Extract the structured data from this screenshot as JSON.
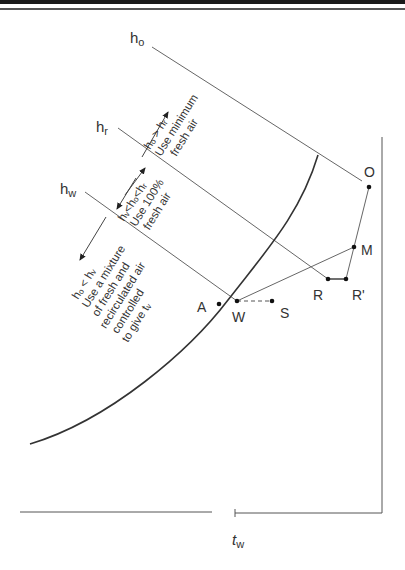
{
  "diagram": {
    "labels": {
      "h_o": "h",
      "h_o_sub": "o",
      "h_r": "h",
      "h_r_sub": "r",
      "h_w": "h",
      "h_w_sub": "w",
      "t_w": "t",
      "t_w_sub": "w"
    },
    "points": {
      "O": "O",
      "M": "M",
      "R": "R",
      "R_prime": "R'",
      "W": "W",
      "S": "S",
      "A": "A"
    },
    "regions": {
      "top": {
        "condition": "hₒ > hᵣ",
        "line1": "Use minimum",
        "line2": "fresh air"
      },
      "middle": {
        "condition": "hᵥ<hₒ<hᵣ",
        "line1": "Use 100%",
        "line2": "fresh air"
      },
      "bottom": {
        "condition": "hₒ < hᵥ",
        "line1": "Use a mixture",
        "line2": "of fresh and",
        "line3": "recirculated air",
        "line4": "controlled",
        "line5": "to give tᵥ"
      }
    }
  }
}
